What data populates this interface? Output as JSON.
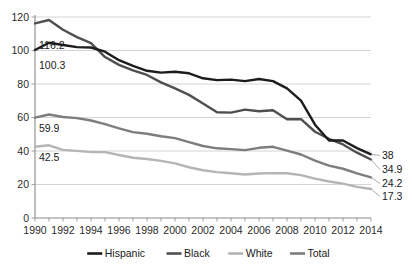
{
  "chart_data": {
    "type": "line",
    "title": "",
    "subtitle": "",
    "xlabel": "",
    "ylabel": "",
    "xlim": [
      1990,
      2014
    ],
    "ylim": [
      0,
      120
    ],
    "grid": true,
    "legend_position": "bottom",
    "y_ticks": [
      "0",
      "20",
      "40",
      "60",
      "80",
      "100",
      "120"
    ],
    "x_ticks": [
      "1990",
      "1992",
      "1994",
      "1996",
      "1998",
      "2000",
      "2002",
      "2004",
      "2006",
      "2008",
      "2010",
      "2012",
      "2014"
    ],
    "x": [
      1990,
      1991,
      1992,
      1993,
      1994,
      1995,
      1996,
      1997,
      1998,
      1999,
      2000,
      2001,
      2002,
      2003,
      2004,
      2005,
      2006,
      2007,
      2008,
      2009,
      2010,
      2011,
      2012,
      2013,
      2014
    ],
    "series": [
      {
        "name": "Hispanic",
        "color": "#1c1c1c",
        "start_label": "100.3",
        "end_label": "38",
        "values": [
          100.3,
          104.6,
          103.3,
          102.0,
          101.8,
          99.3,
          94.2,
          90.8,
          87.9,
          86.8,
          87.3,
          86.4,
          83.4,
          82.3,
          82.6,
          81.7,
          83.0,
          81.7,
          77.4,
          70.1,
          55.7,
          46.3,
          46.3,
          41.7,
          38.0
        ]
      },
      {
        "name": "Black",
        "color": "#4f4f4f",
        "start_label": "116.2",
        "end_label": "34.9",
        "values": [
          116.2,
          118.2,
          112.4,
          108.0,
          104.4,
          96.1,
          91.4,
          88.2,
          85.4,
          81.0,
          77.4,
          73.5,
          68.3,
          63.1,
          62.9,
          64.7,
          63.7,
          64.3,
          59.0,
          59.0,
          51.5,
          47.3,
          43.9,
          39.0,
          34.9
        ]
      },
      {
        "name": "White",
        "color": "#b5b5b5",
        "start_label": "42.5",
        "end_label": "17.3",
        "values": [
          42.5,
          43.4,
          40.7,
          40.1,
          39.3,
          39.3,
          37.6,
          36.0,
          35.2,
          34.1,
          32.6,
          30.3,
          28.5,
          27.4,
          26.7,
          26.0,
          26.6,
          26.8,
          26.7,
          25.6,
          23.5,
          21.8,
          20.5,
          18.6,
          17.3
        ]
      },
      {
        "name": "Total",
        "color": "#7d7d7d",
        "start_label": "59.9",
        "end_label": "24.2",
        "values": [
          59.9,
          61.8,
          60.3,
          59.6,
          58.2,
          56.0,
          53.5,
          51.3,
          50.3,
          48.8,
          47.7,
          45.3,
          43.0,
          41.6,
          41.1,
          40.5,
          41.9,
          42.5,
          40.2,
          37.9,
          34.2,
          31.3,
          29.4,
          26.6,
          24.2
        ]
      }
    ],
    "start_labels": [
      {
        "text": "116.2",
        "series": "Black"
      },
      {
        "text": "100.3",
        "series": "Hispanic"
      },
      {
        "text": "59.9",
        "series": "Total"
      },
      {
        "text": "42.5",
        "series": "White"
      }
    ],
    "end_labels": [
      {
        "text": "38",
        "series": "Hispanic"
      },
      {
        "text": "34.9",
        "series": "Black"
      },
      {
        "text": "24.2",
        "series": "Total"
      },
      {
        "text": "17.3",
        "series": "White"
      }
    ],
    "legend": [
      {
        "label": "Hispanic",
        "color": "#1c1c1c"
      },
      {
        "label": "Black",
        "color": "#4f4f4f"
      },
      {
        "label": "White",
        "color": "#b5b5b5"
      },
      {
        "label": "Total",
        "color": "#7d7d7d"
      }
    ]
  }
}
